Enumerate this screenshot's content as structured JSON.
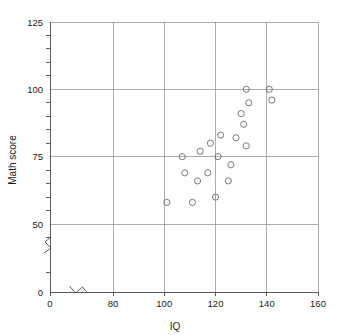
{
  "chart_data": {
    "type": "scatter",
    "title": "",
    "xlabel": "IQ",
    "ylabel": "Math score",
    "xlim": [
      0,
      160
    ],
    "ylim": [
      0,
      125
    ],
    "grid": true,
    "legend": null,
    "x_major_ticks": [
      0,
      80,
      100,
      120,
      140,
      160
    ],
    "x_tick_labels": [
      "0",
      "80",
      "100",
      "120",
      "140",
      "160"
    ],
    "y_major_ticks": [
      0,
      50,
      75,
      100,
      125
    ],
    "y_tick_labels": [
      "0",
      "50",
      "75",
      "100",
      "125"
    ],
    "y_minor_tick_step": 5,
    "x_axis_break": true,
    "y_axis_break": true,
    "x_axis_break_at": 40,
    "y_axis_break_at": 35,
    "marker": "open-circle",
    "points": [
      {
        "x": 101,
        "y": 58
      },
      {
        "x": 107,
        "y": 75
      },
      {
        "x": 108,
        "y": 69
      },
      {
        "x": 111,
        "y": 58
      },
      {
        "x": 113,
        "y": 66
      },
      {
        "x": 114,
        "y": 77
      },
      {
        "x": 117,
        "y": 69
      },
      {
        "x": 118,
        "y": 80
      },
      {
        "x": 120,
        "y": 60
      },
      {
        "x": 121,
        "y": 75
      },
      {
        "x": 122,
        "y": 83
      },
      {
        "x": 125,
        "y": 66
      },
      {
        "x": 126,
        "y": 72
      },
      {
        "x": 128,
        "y": 82
      },
      {
        "x": 130,
        "y": 91
      },
      {
        "x": 131,
        "y": 87
      },
      {
        "x": 132,
        "y": 79
      },
      {
        "x": 132,
        "y": 100
      },
      {
        "x": 133,
        "y": 95
      },
      {
        "x": 141,
        "y": 100
      },
      {
        "x": 142,
        "y": 96
      }
    ]
  },
  "axes": {
    "x_title": "IQ",
    "y_title": "Math score"
  },
  "colors": {
    "grid": "#8a8a8a",
    "axis": "#4a4a4a",
    "marker": "#6b6b6b",
    "text": "#1a1a1a",
    "background": "#ffffff"
  }
}
